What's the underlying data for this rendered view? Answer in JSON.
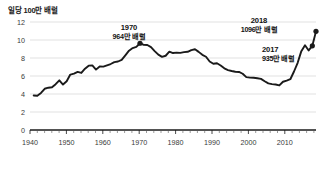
{
  "chart_data": {
    "type": "line",
    "title": "",
    "ylabel": "일당 100만 배럴",
    "xlabel": "",
    "xlim": [
      1940,
      2018
    ],
    "ylim": [
      0,
      12
    ],
    "grid": true,
    "legend": "none",
    "yticks": [
      "0",
      "2",
      "4",
      "6",
      "8",
      "10",
      "12"
    ],
    "ytick_values": [
      0,
      2,
      4,
      6,
      8,
      10,
      12
    ],
    "xticks": [
      "1940",
      "1950",
      "1960",
      "1970",
      "1980",
      "1990",
      "2000",
      "2010"
    ],
    "xtick_values": [
      1940,
      1950,
      1960,
      1970,
      1980,
      1990,
      2000,
      2010
    ],
    "series": [
      {
        "name": "미국 원유 생산량",
        "color": "#1a1a1a",
        "x": [
          1941,
          1942,
          1943,
          1944,
          1945,
          1946,
          1947,
          1948,
          1949,
          1950,
          1951,
          1952,
          1953,
          1954,
          1955,
          1956,
          1957,
          1958,
          1959,
          1960,
          1961,
          1962,
          1963,
          1964,
          1965,
          1966,
          1967,
          1968,
          1969,
          1970,
          1971,
          1972,
          1973,
          1974,
          1975,
          1976,
          1977,
          1978,
          1979,
          1980,
          1981,
          1982,
          1983,
          1984,
          1985,
          1986,
          1987,
          1988,
          1989,
          1990,
          1991,
          1992,
          1993,
          1994,
          1995,
          1996,
          1997,
          1998,
          1999,
          2000,
          2001,
          2002,
          2003,
          2004,
          2005,
          2006,
          2007,
          2008,
          2009,
          2010,
          2011,
          2012,
          2013,
          2014,
          2015,
          2016,
          2017,
          2018
        ],
        "y": [
          3.84,
          3.8,
          4.12,
          4.58,
          4.7,
          4.75,
          5.09,
          5.52,
          5.05,
          5.41,
          6.16,
          6.26,
          6.46,
          6.34,
          6.81,
          7.15,
          7.17,
          6.71,
          7.05,
          7.04,
          7.18,
          7.33,
          7.54,
          7.61,
          7.8,
          8.3,
          8.81,
          9.1,
          9.24,
          9.64,
          9.46,
          9.44,
          9.21,
          8.77,
          8.37,
          8.13,
          8.25,
          8.71,
          8.55,
          8.6,
          8.57,
          8.65,
          8.69,
          8.88,
          8.97,
          8.68,
          8.35,
          8.14,
          7.61,
          7.36,
          7.42,
          7.17,
          6.85,
          6.66,
          6.56,
          6.47,
          6.45,
          6.25,
          5.88,
          5.82,
          5.8,
          5.75,
          5.68,
          5.42,
          5.18,
          5.1,
          5.06,
          4.95,
          5.36,
          5.48,
          5.64,
          6.5,
          7.47,
          8.76,
          9.42,
          8.84,
          9.35,
          10.96
        ],
        "annotated_points": [
          {
            "year": 1970,
            "value": 9.64,
            "label_year": "1970",
            "label_value": "964만 배럴"
          },
          {
            "year": 2017,
            "value": 9.35,
            "label_year": "2017",
            "label_value": "935만 배럴"
          },
          {
            "year": 2018,
            "value": 10.96,
            "label_year": "2018",
            "label_value": "1096만 배럴"
          }
        ]
      }
    ]
  },
  "annotations": [
    {
      "id": "annot-1970",
      "year": "1970",
      "value": "964만 배럴"
    },
    {
      "id": "annot-2018",
      "year": "2018",
      "value": "1096만 배럴"
    },
    {
      "id": "annot-2017",
      "year": "2017",
      "value": "935만 배럴"
    }
  ],
  "axis": {
    "y_title": "일당 100만 배럴",
    "y_labels": [
      "12",
      "10",
      "8",
      "6",
      "4",
      "2",
      "0"
    ],
    "x_labels": [
      "1940",
      "1950",
      "1960",
      "1970",
      "1980",
      "1990",
      "2000",
      "2010"
    ]
  },
  "colors": {
    "line": "#1a1a1a",
    "grid": "#d9d9d9",
    "axis": "#1a1a1a",
    "text": "#1a1a1a",
    "background": "#ffffff"
  }
}
